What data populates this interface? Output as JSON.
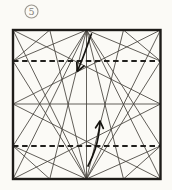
{
  "step": {
    "number": "5"
  },
  "colors": {
    "paper": "#fbfaf6",
    "border": "#1e1c19",
    "crease": "#46423c",
    "fold_dash": "#21201d",
    "arrow": "#15130f",
    "step_label": "#85827c",
    "step_circle": "#9a968e"
  },
  "square": {
    "x": 13,
    "y": 30,
    "width": 147.5,
    "height": 149
  },
  "step_badge": {
    "cx": 31.5,
    "cy": 11.5,
    "r": 6.5,
    "text_x": 31.5,
    "text_y": 15
  },
  "creases": [
    [
      86.5,
      30,
      86.5,
      179
    ],
    [
      13,
      104,
      160.5,
      104
    ],
    [
      13,
      30,
      160.5,
      104
    ],
    [
      13,
      30,
      86.5,
      179
    ],
    [
      160.5,
      30,
      13,
      104
    ],
    [
      160.5,
      30,
      86.5,
      179
    ],
    [
      13,
      179,
      160.5,
      104
    ],
    [
      13,
      179,
      86.5,
      30
    ],
    [
      160.5,
      179,
      13,
      104
    ],
    [
      160.5,
      179,
      86.5,
      30
    ],
    [
      13,
      61,
      86.5,
      30
    ],
    [
      13,
      61,
      86.5,
      179
    ],
    [
      160.5,
      61,
      86.5,
      30
    ],
    [
      160.5,
      61,
      86.5,
      179
    ],
    [
      13,
      146,
      86.5,
      30
    ],
    [
      13,
      146,
      86.5,
      179
    ],
    [
      160.5,
      146,
      86.5,
      30
    ],
    [
      160.5,
      146,
      86.5,
      179
    ],
    [
      49.75,
      30,
      13,
      61
    ],
    [
      123.5,
      30,
      160.5,
      61
    ],
    [
      49.75,
      179,
      13,
      146
    ],
    [
      123.5,
      179,
      160.5,
      146
    ],
    [
      49.75,
      30,
      86.5,
      179
    ],
    [
      123.5,
      30,
      86.5,
      179
    ],
    [
      49.75,
      179,
      86.5,
      30
    ],
    [
      123.5,
      179,
      86.5,
      30
    ]
  ],
  "fold_lines": [
    {
      "x1": 13,
      "y1": 61,
      "x2": 160.5,
      "y2": 61
    },
    {
      "x1": 13,
      "y1": 146,
      "x2": 160.5,
      "y2": 146
    }
  ],
  "arrows": [
    {
      "name": "fold-arrow-top",
      "stroke": "M91.5,34 C88,42 85.5,53 77.5,70.5",
      "head": "M84,66 L77.3,71.3 L76.8,62.6"
    },
    {
      "name": "fold-arrow-bottom",
      "stroke": "M88,166 C92,158 98.5,146 100,122",
      "head": "M103.3,128.4 L100,121 L95.6,127.8"
    }
  ]
}
